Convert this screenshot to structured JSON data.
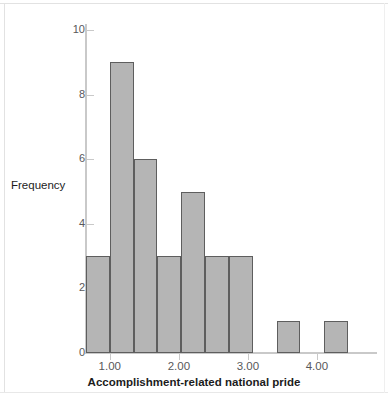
{
  "chart_data": {
    "type": "bar",
    "title": "",
    "subtitle": "",
    "xlabel": "Accomplishment-related national pride",
    "ylabel": "Frequency",
    "xlim": [
      0.655,
      4.45
    ],
    "ylim": [
      0,
      10
    ],
    "grid": false,
    "legend": null,
    "x_tick_labels": [
      "1.00",
      "2.00",
      "3.00",
      "4.00"
    ],
    "x_tick_values": [
      1.0,
      2.0,
      3.0,
      4.0
    ],
    "y_tick_labels": [
      "0",
      "2",
      "4",
      "6",
      "8",
      "10"
    ],
    "y_tick_values": [
      0,
      2,
      4,
      6,
      8,
      10
    ],
    "bin_width": 0.345,
    "bars": [
      {
        "bin_start": 0.655,
        "bin_end": 1.0,
        "center": 0.83,
        "value": 3
      },
      {
        "bin_start": 1.0,
        "bin_end": 1.345,
        "center": 1.17,
        "value": 9
      },
      {
        "bin_start": 1.345,
        "bin_end": 1.69,
        "center": 1.52,
        "value": 6
      },
      {
        "bin_start": 1.69,
        "bin_end": 2.035,
        "center": 1.86,
        "value": 3
      },
      {
        "bin_start": 2.035,
        "bin_end": 2.38,
        "center": 2.21,
        "value": 5
      },
      {
        "bin_start": 2.38,
        "bin_end": 2.725,
        "center": 2.55,
        "value": 3
      },
      {
        "bin_start": 2.725,
        "bin_end": 3.07,
        "center": 2.9,
        "value": 3
      },
      {
        "bin_start": 3.07,
        "bin_end": 3.415,
        "center": 3.24,
        "value": 0
      },
      {
        "bin_start": 3.415,
        "bin_end": 3.76,
        "center": 3.59,
        "value": 1
      },
      {
        "bin_start": 3.76,
        "bin_end": 4.105,
        "center": 3.93,
        "value": 0
      },
      {
        "bin_start": 4.105,
        "bin_end": 4.45,
        "center": 4.28,
        "value": 1
      }
    ],
    "categories": [
      "0.83",
      "1.17",
      "1.52",
      "1.86",
      "2.21",
      "2.55",
      "2.90",
      "3.24",
      "3.59",
      "3.93",
      "4.28"
    ],
    "values": [
      3,
      9,
      6,
      3,
      5,
      3,
      3,
      0,
      1,
      0,
      1
    ],
    "colors": {
      "bar_fill": "#b5b5b5",
      "bar_edge": "#5e5e5e",
      "axis": "#c9c9c9",
      "tick_label": "#58585a",
      "axis_title": "#1c1c1c",
      "background": "#ffffff",
      "frame": "#e2e2e2"
    }
  }
}
